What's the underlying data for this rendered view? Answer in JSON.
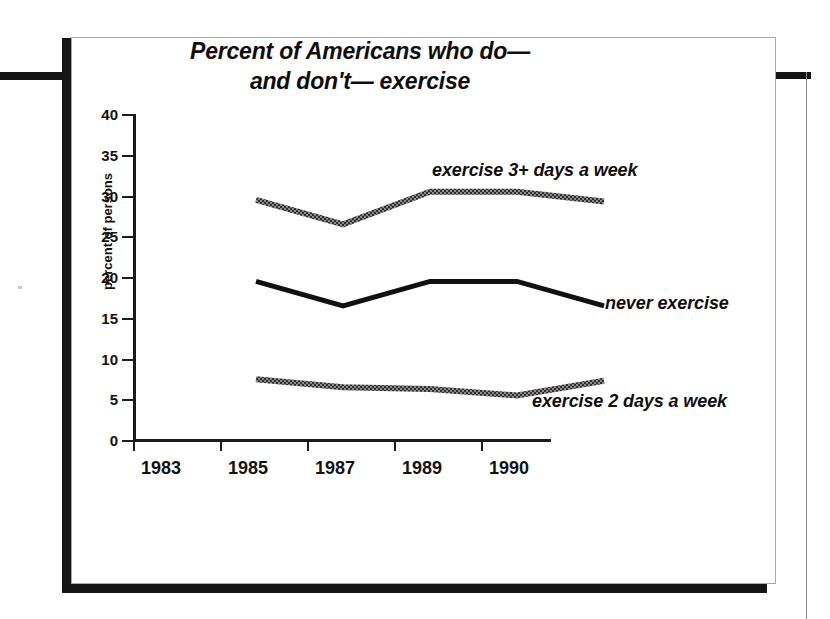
{
  "figure": {
    "title_line1": "Percent of Americans who do—",
    "title_line2": "and don't— exercise"
  },
  "chart_data": {
    "type": "line",
    "title": "Percent of Americans who do— and don't— exercise",
    "xlabel": "",
    "ylabel": "percent of persons",
    "x": [
      1983,
      1985,
      1987,
      1989,
      1990
    ],
    "categories": [
      "1983",
      "1985",
      "1987",
      "1989",
      "1990"
    ],
    "ylim": [
      0,
      40
    ],
    "yticks": [
      0,
      5,
      10,
      15,
      20,
      25,
      30,
      35,
      40
    ],
    "ytick_labels": [
      "0",
      "5",
      "10",
      "15",
      "20",
      "25",
      "30",
      "35",
      "40"
    ],
    "grid": false,
    "legend_position": "inline-annotations",
    "series": [
      {
        "name": "exercise 3+ days a week",
        "values": [
          34,
          31,
          35,
          35,
          33.8
        ],
        "color": "#333333",
        "style": "textured"
      },
      {
        "name": "never exercise",
        "values": [
          24,
          21,
          24,
          24,
          21
        ],
        "color": "#111111",
        "style": "solid"
      },
      {
        "name": "exercise 2 days a week",
        "values": [
          12,
          11,
          10.8,
          10,
          11.8
        ],
        "color": "#3a3a3a",
        "style": "textured"
      }
    ],
    "annotations": [
      "exercise 3+ days a week",
      "never exercise",
      "exercise 2 days a week"
    ]
  },
  "colors": {
    "frame": "#141414",
    "panel_border": "#a8a8a8",
    "background": "#ffffff",
    "ink": "#121212"
  }
}
